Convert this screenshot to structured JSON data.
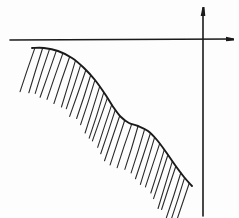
{
  "figure": {
    "kind": "hand-drawn-sketch",
    "title": "",
    "caption": "",
    "canvas": {
      "width": 239,
      "height": 218
    },
    "background_color": "#fdfdfd",
    "ink_color": "#1a1a1a"
  },
  "axes": {
    "name": "cartesian-axes",
    "origin": {
      "x": 203,
      "y": 39
    },
    "x_axis": {
      "label": "",
      "start": {
        "x": 10,
        "y": 40
      },
      "end": {
        "x": 233,
        "y": 39
      },
      "stroke_width": 1.6,
      "arrow": "right",
      "arrow_style": "blob"
    },
    "y_axis": {
      "label": "",
      "start": {
        "x": 203,
        "y": 216
      },
      "end": {
        "x": 203,
        "y": 8
      },
      "stroke_width": 1.6,
      "arrow": "up",
      "arrow_style": "blob"
    }
  },
  "curve": {
    "name": "boundary-curve",
    "shape": "decreasing-sigmoid-with-plateau",
    "stroke_width": 1.9,
    "stroke_color": "#1a1a1a",
    "points": [
      {
        "x": 32,
        "y": 48
      },
      {
        "x": 44,
        "y": 48
      },
      {
        "x": 58,
        "y": 51
      },
      {
        "x": 72,
        "y": 58
      },
      {
        "x": 84,
        "y": 68
      },
      {
        "x": 95,
        "y": 80
      },
      {
        "x": 105,
        "y": 94
      },
      {
        "x": 114,
        "y": 108
      },
      {
        "x": 121,
        "y": 117
      },
      {
        "x": 129,
        "y": 123
      },
      {
        "x": 138,
        "y": 126
      },
      {
        "x": 148,
        "y": 131
      },
      {
        "x": 157,
        "y": 140
      },
      {
        "x": 166,
        "y": 152
      },
      {
        "x": 175,
        "y": 165
      },
      {
        "x": 184,
        "y": 177
      },
      {
        "x": 192,
        "y": 186
      }
    ]
  },
  "hatching": {
    "name": "region-hatching",
    "meaning": "shaded-region-below-curve",
    "count": 31,
    "angle_degrees": 72,
    "stroke_length": 47,
    "stroke_width": 1.1,
    "stroke_color": "#2b2b2b",
    "spacing": 5.3,
    "direction": "down-left"
  }
}
